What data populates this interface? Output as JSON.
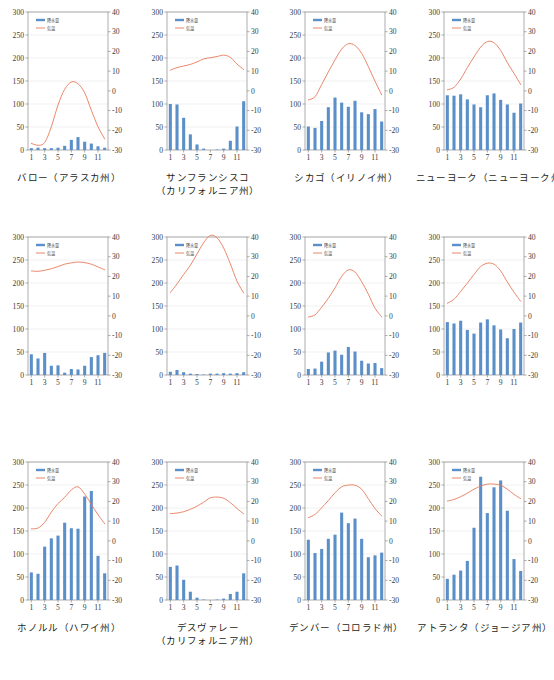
{
  "figure": {
    "type": "small-multiples-climograph",
    "rows": 3,
    "cols": 4,
    "precip_color": "#5B8FC9",
    "temp_color": "#E8795A",
    "axis_color": "#8a8a8a",
    "grid_color": "#e2e2e2"
  },
  "legend": {
    "precip_label": "降水量",
    "temp_label": "気温"
  },
  "axes": {
    "left_ticks": [
      "300",
      "250",
      "200",
      "150",
      "100",
      "50",
      "0"
    ],
    "left_values": [
      300,
      250,
      200,
      150,
      100,
      50,
      0
    ],
    "right_ticks": [
      "40",
      "30",
      "20",
      "10",
      "0",
      "-10",
      "-20",
      "-30"
    ],
    "right_values": [
      40,
      30,
      20,
      10,
      0,
      -10,
      -20,
      -30
    ],
    "x_ticks": [
      "1",
      "3",
      "5",
      "7",
      "9",
      "11"
    ],
    "x_tick_months": [
      1,
      3,
      5,
      7,
      9,
      11
    ],
    "months": [
      1,
      2,
      3,
      4,
      5,
      6,
      7,
      8,
      9,
      10,
      11,
      12
    ],
    "precip_range": [
      0,
      300
    ],
    "temp_range": [
      -30,
      40
    ]
  },
  "chart_data": [
    {
      "type": "bar",
      "id": "barrow",
      "title": "バロー（アラスカ州）",
      "caption_lines": [
        "バロー（アラスカ州）"
      ],
      "categories": [
        1,
        2,
        3,
        4,
        5,
        6,
        7,
        8,
        9,
        10,
        11,
        12
      ],
      "xlabel": "",
      "ylabel": "降水量",
      "ylim": [
        0,
        300
      ],
      "y2lim": [
        -30,
        40
      ],
      "series": [
        {
          "name": "降水量",
          "type": "bar",
          "values": [
            4,
            5,
            4,
            4,
            5,
            9,
            22,
            28,
            18,
            14,
            8,
            5
          ]
        },
        {
          "name": "気温",
          "type": "line",
          "values": [
            -26.6,
            -27.6,
            -26.2,
            -18.2,
            -7.2,
            0.8,
            4.5,
            3.6,
            -1.0,
            -9.8,
            -18.2,
            -24.4
          ]
        }
      ]
    },
    {
      "type": "bar",
      "id": "san-francisco",
      "title": "サンフランシスコ（カリフォルニア州）",
      "caption_lines": [
        "サンフランシスコ",
        "（カリフォルニア州）"
      ],
      "categories": [
        1,
        2,
        3,
        4,
        5,
        6,
        7,
        8,
        9,
        10,
        11,
        12
      ],
      "xlabel": "",
      "ylabel": "降水量",
      "ylim": [
        0,
        300
      ],
      "y2lim": [
        -30,
        40
      ],
      "series": [
        {
          "name": "降水量",
          "type": "bar",
          "values": [
            100,
            99,
            70,
            34,
            12,
            3,
            0,
            1,
            3,
            20,
            51,
            106
          ]
        },
        {
          "name": "気温",
          "type": "line",
          "values": [
            10.5,
            11.8,
            12.6,
            13.4,
            14.7,
            16.2,
            16.8,
            17.4,
            18.1,
            17.0,
            13.6,
            10.8
          ]
        }
      ]
    },
    {
      "type": "bar",
      "id": "chicago",
      "title": "シカゴ（イリノイ州）",
      "caption_lines": [
        "シカゴ（イリノイ州）"
      ],
      "categories": [
        1,
        2,
        3,
        4,
        5,
        6,
        7,
        8,
        9,
        10,
        11,
        12
      ],
      "xlabel": "",
      "ylabel": "降水量",
      "ylim": [
        0,
        300
      ],
      "y2lim": [
        -30,
        40
      ],
      "series": [
        {
          "name": "降水量",
          "type": "bar",
          "values": [
            51,
            48,
            63,
            93,
            114,
            103,
            94,
            107,
            82,
            78,
            89,
            62
          ]
        },
        {
          "name": "気温",
          "type": "line",
          "values": [
            -4.6,
            -3.0,
            3.2,
            9.6,
            15.7,
            21.2,
            23.9,
            23.0,
            19.0,
            12.3,
            4.9,
            -2.0
          ]
        }
      ]
    },
    {
      "type": "bar",
      "id": "new-york",
      "title": "ニューヨーク（ニューヨーク州）",
      "caption_lines": [
        "ニューヨーク（ニューヨーク州）"
      ],
      "categories": [
        1,
        2,
        3,
        4,
        5,
        6,
        7,
        8,
        9,
        10,
        11,
        12
      ],
      "xlabel": "",
      "ylabel": "降水量",
      "ylim": [
        0,
        300
      ],
      "y2lim": [
        -30,
        40
      ],
      "series": [
        {
          "name": "降水量",
          "type": "bar",
          "values": [
            119,
            118,
            121,
            110,
            99,
            93,
            119,
            123,
            109,
            99,
            81,
            101
          ]
        },
        {
          "name": "気温",
          "type": "line",
          "values": [
            0.5,
            1.8,
            6.0,
            11.8,
            17.2,
            22.2,
            25.0,
            24.4,
            20.5,
            14.3,
            8.9,
            3.2
          ]
        }
      ]
    },
    {
      "type": "bar",
      "id": "honolulu",
      "title": "ホノルル（ハワイ州）",
      "caption_lines": [
        "ホノルル（ハワイ州）"
      ],
      "categories": [
        1,
        2,
        3,
        4,
        5,
        6,
        7,
        8,
        9,
        10,
        11,
        12
      ],
      "xlabel": "",
      "ylabel": "降水量",
      "ylim": [
        0,
        300
      ],
      "y2lim": [
        -30,
        40
      ],
      "series": [
        {
          "name": "降水量",
          "type": "bar",
          "values": [
            45,
            36,
            48,
            20,
            21,
            5,
            13,
            12,
            20,
            39,
            43,
            48
          ]
        },
        {
          "name": "気温",
          "type": "line",
          "values": [
            22.8,
            22.6,
            23.1,
            23.9,
            25.0,
            26.2,
            26.9,
            27.3,
            27.0,
            26.2,
            24.8,
            23.4
          ]
        }
      ]
    },
    {
      "type": "bar",
      "id": "death-valley",
      "title": "デスヴァレー（カリフォルニア州）",
      "caption_lines": [
        "デスヴァレー",
        "（カリフォルニア州）"
      ],
      "categories": [
        1,
        2,
        3,
        4,
        5,
        6,
        7,
        8,
        9,
        10,
        11,
        12
      ],
      "xlabel": "",
      "ylabel": "降水量",
      "ylim": [
        0,
        300
      ],
      "y2lim": [
        -30,
        40
      ],
      "series": [
        {
          "name": "降水量",
          "type": "bar",
          "values": [
            7,
            11,
            6,
            3,
            2,
            1,
            3,
            3,
            4,
            3,
            4,
            6
          ]
        },
        {
          "name": "気温",
          "type": "line",
          "values": [
            11.8,
            16.2,
            21.0,
            25.6,
            31.4,
            37.1,
            40.8,
            39.6,
            34.4,
            26.4,
            17.6,
            11.6
          ]
        }
      ]
    },
    {
      "type": "bar",
      "id": "denver",
      "title": "デンバー（コロラド州）",
      "caption_lines": [
        "デンバー（コロラド州）"
      ],
      "categories": [
        1,
        2,
        3,
        4,
        5,
        6,
        7,
        8,
        9,
        10,
        11,
        12
      ],
      "xlabel": "",
      "ylabel": "降水量",
      "ylim": [
        0,
        300
      ],
      "y2lim": [
        -30,
        40
      ],
      "series": [
        {
          "name": "降水量",
          "type": "bar",
          "values": [
            13,
            14,
            29,
            49,
            53,
            44,
            61,
            51,
            31,
            25,
            26,
            15
          ]
        },
        {
          "name": "気温",
          "type": "line",
          "values": [
            -0.6,
            0.5,
            4.4,
            8.9,
            14.2,
            20.0,
            23.3,
            22.2,
            17.3,
            11.0,
            3.9,
            -0.5
          ]
        }
      ]
    },
    {
      "type": "bar",
      "id": "atlanta",
      "title": "アトランタ（ジョージア州）",
      "caption_lines": [
        "アトランタ（ジョージア州）"
      ],
      "categories": [
        1,
        2,
        3,
        4,
        5,
        6,
        7,
        8,
        9,
        10,
        11,
        12
      ],
      "xlabel": "",
      "ylabel": "降水量",
      "ylim": [
        0,
        300
      ],
      "y2lim": [
        -30,
        40
      ],
      "series": [
        {
          "name": "降水量",
          "type": "bar",
          "values": [
            115,
            112,
            118,
            98,
            90,
            114,
            121,
            108,
            99,
            80,
            100,
            114
          ]
        },
        {
          "name": "気温",
          "type": "line",
          "values": [
            6.4,
            8.4,
            12.4,
            16.6,
            21.0,
            25.0,
            26.7,
            26.2,
            22.8,
            17.2,
            12.0,
            7.4
          ]
        }
      ]
    },
    {
      "type": "bar",
      "id": "tokyo",
      "title": "東京",
      "caption_lines": [
        "東京"
      ],
      "categories": [
        1,
        2,
        3,
        4,
        5,
        6,
        7,
        8,
        9,
        10,
        11,
        12
      ],
      "xlabel": "",
      "ylabel": "降水量",
      "ylim": [
        0,
        300
      ],
      "y2lim": [
        -30,
        40
      ],
      "series": [
        {
          "name": "降水量",
          "type": "bar",
          "values": [
            60,
            57,
            116,
            134,
            140,
            168,
            156,
            155,
            225,
            237,
            96,
            58
          ]
        },
        {
          "name": "気温",
          "type": "line",
          "values": [
            6.1,
            6.5,
            9.4,
            14.6,
            18.9,
            22.1,
            25.8,
            27.4,
            23.8,
            18.5,
            13.3,
            8.7
          ]
        }
      ]
    },
    {
      "type": "bar",
      "id": "los-angeles",
      "title": "ロサンゼルス（カリフォルニア州）",
      "caption_lines": [
        "ロサンゼルス",
        "（カリフォルニア州）"
      ],
      "categories": [
        1,
        2,
        3,
        4,
        5,
        6,
        7,
        8,
        9,
        10,
        11,
        12
      ],
      "xlabel": "",
      "ylabel": "降水量",
      "ylim": [
        0,
        300
      ],
      "y2lim": [
        -30,
        40
      ],
      "series": [
        {
          "name": "降水量",
          "type": "bar",
          "values": [
            72,
            75,
            44,
            18,
            5,
            1,
            0,
            1,
            3,
            13,
            18,
            58
          ]
        },
        {
          "name": "気温",
          "type": "line",
          "values": [
            13.8,
            14.1,
            14.8,
            16.0,
            17.6,
            19.6,
            21.8,
            22.2,
            21.6,
            19.4,
            16.4,
            13.7
          ]
        }
      ]
    },
    {
      "type": "bar",
      "id": "new-orleans",
      "title": "ニューオーリンズ（ルイジアナ州）",
      "caption_lines": [
        "ニューオーリンズ",
        "（ルイジアナ州）"
      ],
      "categories": [
        1,
        2,
        3,
        4,
        5,
        6,
        7,
        8,
        9,
        10,
        11,
        12
      ],
      "xlabel": "",
      "ylabel": "降水量",
      "ylim": [
        0,
        300
      ],
      "y2lim": [
        -30,
        40
      ],
      "series": [
        {
          "name": "降水量",
          "type": "bar",
          "values": [
            131,
            102,
            111,
            133,
            142,
            190,
            167,
            177,
            133,
            93,
            97,
            103
          ]
        },
        {
          "name": "気温",
          "type": "line",
          "values": [
            11.8,
            13.4,
            16.8,
            20.4,
            24.4,
            27.4,
            28.3,
            28.2,
            26.2,
            21.4,
            16.4,
            12.6
          ]
        }
      ]
    },
    {
      "type": "bar",
      "id": "miami",
      "title": "マイアミ（フロリダ州）",
      "caption_lines": [
        "マイアミ（フロリダ州）"
      ],
      "categories": [
        1,
        2,
        3,
        4,
        5,
        6,
        7,
        8,
        9,
        10,
        11,
        12
      ],
      "xlabel": "",
      "ylabel": "降水量",
      "ylim": [
        0,
        300
      ],
      "y2lim": [
        -30,
        40
      ],
      "series": [
        {
          "name": "降水量",
          "type": "bar",
          "values": [
            46,
            55,
            64,
            85,
            157,
            268,
            189,
            245,
            260,
            194,
            89,
            63
          ]
        },
        {
          "name": "気温",
          "type": "line",
          "values": [
            20.2,
            21.0,
            22.4,
            24.2,
            26.2,
            27.8,
            28.8,
            28.8,
            28.2,
            26.2,
            23.6,
            21.4
          ]
        }
      ]
    }
  ]
}
